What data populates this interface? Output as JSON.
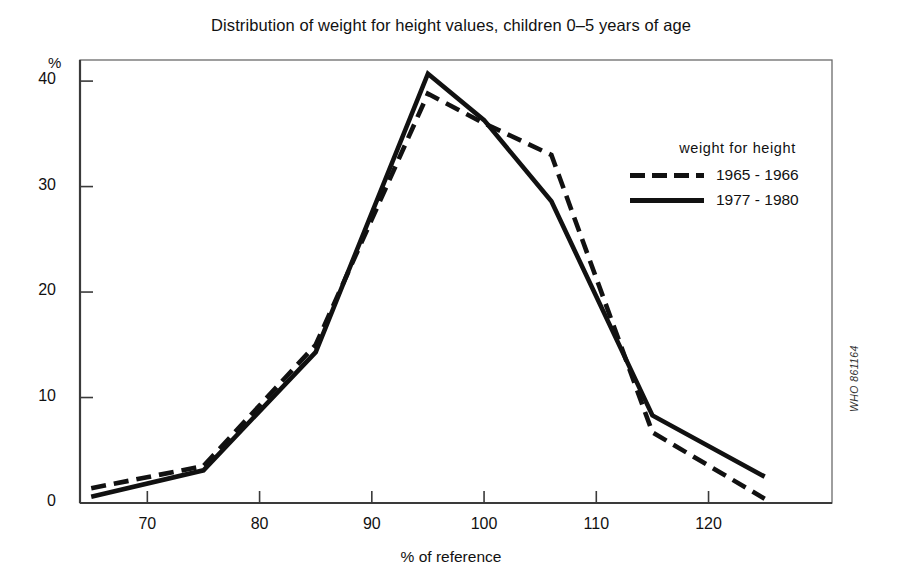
{
  "chart_data": {
    "type": "line",
    "title": "Distribution of weight for height values, children 0–5 years of age",
    "xlabel": "% of reference",
    "ylabel": "%",
    "xlim": [
      64,
      131
    ],
    "ylim": [
      0,
      42
    ],
    "xticks": [
      70,
      80,
      90,
      100,
      110,
      120
    ],
    "yticks": [
      0,
      10,
      20,
      30,
      40
    ],
    "xtick_labels": [
      "70",
      "80",
      "90",
      "100",
      "110",
      "120"
    ],
    "ytick_labels": [
      "0",
      "10",
      "20",
      "30",
      "40"
    ],
    "grid": false,
    "legend_position": "right-upper",
    "legend_title": "weight for height",
    "x": [
      65,
      75,
      85,
      95,
      100,
      106,
      115,
      125
    ],
    "series": [
      {
        "name": "1965 - 1966",
        "style": "dashed",
        "color": "#111111",
        "values": [
          1.4,
          3.5,
          15.0,
          38.8,
          36.0,
          33.0,
          6.7,
          0.4
        ]
      },
      {
        "name": "1977 - 1980",
        "style": "solid",
        "color": "#111111",
        "values": [
          0.6,
          3.1,
          14.3,
          40.7,
          36.3,
          28.6,
          8.3,
          2.5
        ]
      }
    ]
  },
  "figure": {
    "title": "Distribution of weight for height values, children 0–5 years of age",
    "y_unit": "%",
    "x_axis_title": "% of reference",
    "source_code": "WHO 861164",
    "legend": {
      "title": "weight for height",
      "entries": [
        {
          "label": "1965 - 1966",
          "style": "dashed"
        },
        {
          "label": "1977 - 1980",
          "style": "solid"
        }
      ]
    }
  }
}
